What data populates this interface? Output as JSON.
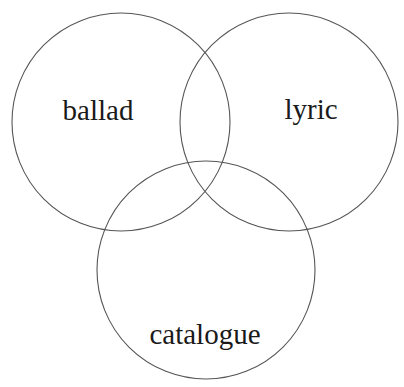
{
  "diagram": {
    "type": "venn",
    "stroke_color": "#555555",
    "text_color": "#1a1a1a",
    "background": "#ffffff",
    "sets": [
      {
        "id": "ballad",
        "label": "ballad",
        "cx": 121,
        "cy": 122,
        "r": 109,
        "label_x": 98,
        "label_y": 96
      },
      {
        "id": "lyric",
        "label": "lyric",
        "cx": 289,
        "cy": 122,
        "r": 109,
        "label_x": 311,
        "label_y": 95
      },
      {
        "id": "catalogue",
        "label": "catalogue",
        "cx": 206,
        "cy": 270,
        "r": 109,
        "label_x": 205,
        "label_y": 320
      }
    ]
  }
}
